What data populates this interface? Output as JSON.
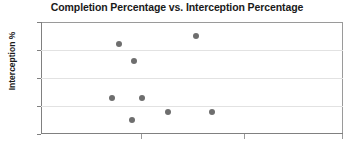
{
  "chart_data": {
    "type": "scatter",
    "title": "Completion Percentage vs. Interception Percentage",
    "xlabel": "",
    "ylabel": "Interception %",
    "ylim": [
      1,
      5
    ],
    "yticks": [
      1,
      2,
      3,
      4,
      5
    ],
    "ytick_labels": [
      "1",
      "2",
      "3",
      "4",
      "5"
    ],
    "xlim": [
      0,
      100
    ],
    "xticks": [],
    "xtick_labels": [],
    "grid": "horizontal",
    "legend": "none",
    "marker_color": "#6e6e6e",
    "points": [
      {
        "x": 25.8,
        "y": 4.2
      },
      {
        "x": 30.8,
        "y": 3.6
      },
      {
        "x": 51.3,
        "y": 4.5
      },
      {
        "x": 23.5,
        "y": 2.3
      },
      {
        "x": 33.4,
        "y": 2.3
      },
      {
        "x": 30.1,
        "y": 1.5
      },
      {
        "x": 42.1,
        "y": 1.8
      },
      {
        "x": 56.6,
        "y": 1.8
      }
    ],
    "x_tick_positions_pct": [
      33.1,
      67.2,
      99.7
    ]
  },
  "colors": {
    "marker": "#6e6e6e",
    "gridline": "#e2e2e2",
    "axis": "#808080",
    "text": "#1a1a1a",
    "background": "#ffffff"
  }
}
